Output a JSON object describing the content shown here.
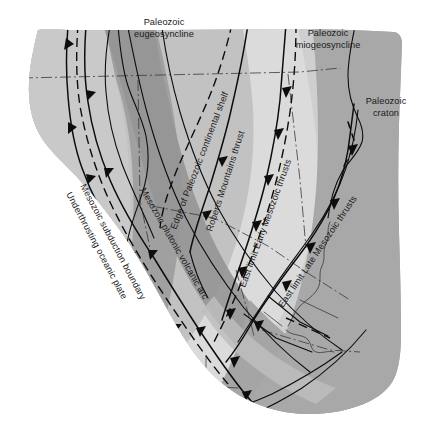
{
  "figure": {
    "name": "tectonic-belt-map",
    "type": "geologic-schematic-map",
    "background_color": "#ffffff"
  },
  "palette": {
    "craton_gray": "#a8a8a8",
    "miogeosyncline_light": "#cfcfcf",
    "shelf_lightest": "#dcdcdc",
    "eugeosyncline_mid": "#bdbdbd",
    "arc_dark": "#9a9a9a",
    "oceanic_light": "#c4c4c4",
    "line_black": "#0d0d0d"
  },
  "labels": {
    "eugeosyncline": {
      "line1": "Paleozoic",
      "line2": "eugeosyncline",
      "orientation": "horizontal"
    },
    "miogeosyncline": {
      "line1": "Paleozoic",
      "line2": "miogeosyncline",
      "orientation": "horizontal"
    },
    "craton": {
      "line1": "Paleozoic",
      "line2": "craton",
      "orientation": "horizontal"
    },
    "subduction_boundary": {
      "text": "Mesozoic subduction boundary",
      "orientation": "rotated"
    },
    "underthrusting_plate": {
      "text": "Underthrusting oceanic plate",
      "orientation": "rotated"
    },
    "plutonic_arc": {
      "text": "Mesozoic plutonic volcanic arc",
      "orientation": "rotated"
    },
    "shelf_edge": {
      "text": "Edge of Paleozoic continental shelf",
      "orientation": "rotated"
    },
    "roberts_thrust": {
      "text": "Roberts Mountains thrust",
      "orientation": "rotated"
    },
    "early_mesozoic": {
      "text": "East limit Early Mesozoic thrusts",
      "orientation": "rotated"
    },
    "late_mesozoic": {
      "text": "East limit Late Mesozoic thrusts",
      "orientation": "rotated"
    }
  },
  "line_types": {
    "thrust_fault": "solid with triangular teeth",
    "shelf_edge_style": "long dash",
    "early_limit_style": "long dash with teeth",
    "state_border_style": "dash-dot thin"
  }
}
